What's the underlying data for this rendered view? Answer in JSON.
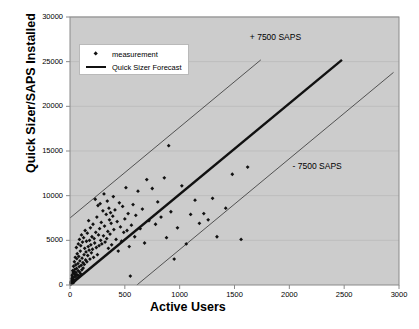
{
  "chart_data": {
    "type": "scatter",
    "title": "",
    "xlabel": "Active Users",
    "ylabel": "Quick Sizer/SAPS Installed",
    "xlim": [
      0,
      3000
    ],
    "ylim": [
      0,
      30000
    ],
    "xticks": [
      0,
      500,
      1000,
      1500,
      2000,
      2500,
      3000
    ],
    "yticks": [
      0,
      5000,
      10000,
      15000,
      20000,
      25000,
      30000
    ],
    "grid": "horizontal",
    "legend_position": "upper-left-inside",
    "legend": [
      {
        "label": "measurement",
        "marker": "diamond",
        "color": "#111111"
      },
      {
        "label": "Quick Sizer Forecast",
        "marker": "line",
        "color": "#111111"
      }
    ],
    "annotations": [
      {
        "text": "+ 7500 SAPS",
        "x": 1640,
        "y": 28300
      },
      {
        "text": "- 7500 SAPS",
        "x": 2030,
        "y": 13900
      }
    ],
    "series": [
      {
        "name": "Quick Sizer Forecast",
        "type": "line",
        "style": "thick",
        "color": "#111111",
        "points": [
          [
            0,
            0
          ],
          [
            2480,
            25200
          ]
        ]
      },
      {
        "name": "+ 7500 SAPS",
        "type": "line",
        "style": "thin",
        "color": "#444444",
        "points": [
          [
            0,
            7500
          ],
          [
            1740,
            25200
          ]
        ]
      },
      {
        "name": "- 7500 SAPS",
        "type": "line",
        "style": "thin",
        "color": "#444444",
        "points": [
          [
            610,
            0
          ],
          [
            2950,
            23800
          ]
        ]
      },
      {
        "name": "measurement",
        "type": "scatter",
        "marker": "diamond",
        "color": "#111111",
        "points": [
          [
            8,
            250
          ],
          [
            10,
            420
          ],
          [
            12,
            150
          ],
          [
            14,
            700
          ],
          [
            16,
            300
          ],
          [
            18,
            1100
          ],
          [
            20,
            480
          ],
          [
            22,
            900
          ],
          [
            24,
            1600
          ],
          [
            26,
            200
          ],
          [
            28,
            1350
          ],
          [
            30,
            600
          ],
          [
            32,
            2100
          ],
          [
            34,
            850
          ],
          [
            36,
            1500
          ],
          [
            38,
            380
          ],
          [
            40,
            2600
          ],
          [
            42,
            1200
          ],
          [
            44,
            1750
          ],
          [
            46,
            520
          ],
          [
            48,
            3100
          ],
          [
            50,
            980
          ],
          [
            52,
            2250
          ],
          [
            54,
            1400
          ],
          [
            56,
            640
          ],
          [
            58,
            4200
          ],
          [
            60,
            1850
          ],
          [
            62,
            2950
          ],
          [
            64,
            1150
          ],
          [
            66,
            3500
          ],
          [
            70,
            800
          ],
          [
            72,
            2400
          ],
          [
            74,
            1600
          ],
          [
            76,
            4600
          ],
          [
            78,
            1050
          ],
          [
            80,
            3200
          ],
          [
            84,
            2050
          ],
          [
            86,
            5100
          ],
          [
            88,
            1450
          ],
          [
            90,
            2700
          ],
          [
            94,
            3800
          ],
          [
            96,
            1250
          ],
          [
            98,
            4400
          ],
          [
            102,
            2200
          ],
          [
            105,
            5600
          ],
          [
            108,
            1700
          ],
          [
            110,
            3000
          ],
          [
            114,
            4800
          ],
          [
            118,
            2500
          ],
          [
            120,
            1900
          ],
          [
            124,
            5300
          ],
          [
            128,
            3400
          ],
          [
            130,
            2300
          ],
          [
            134,
            4100
          ],
          [
            138,
            6100
          ],
          [
            142,
            2800
          ],
          [
            146,
            3700
          ],
          [
            150,
            4900
          ],
          [
            154,
            2600
          ],
          [
            158,
            5800
          ],
          [
            162,
            3300
          ],
          [
            166,
            4300
          ],
          [
            170,
            7200
          ],
          [
            174,
            3900
          ],
          [
            178,
            5000
          ],
          [
            182,
            2900
          ],
          [
            186,
            6400
          ],
          [
            190,
            4500
          ],
          [
            195,
            3600
          ],
          [
            200,
            5400
          ],
          [
            205,
            4000
          ],
          [
            210,
            6800
          ],
          [
            215,
            3100
          ],
          [
            220,
            5200
          ],
          [
            225,
            4700
          ],
          [
            230,
            9600
          ],
          [
            235,
            5900
          ],
          [
            240,
            4200
          ],
          [
            245,
            7600
          ],
          [
            250,
            3400
          ],
          [
            255,
            8900
          ],
          [
            260,
            5600
          ],
          [
            265,
            4400
          ],
          [
            270,
            6300
          ],
          [
            275,
            9100
          ],
          [
            280,
            5000
          ],
          [
            285,
            7000
          ],
          [
            290,
            4600
          ],
          [
            300,
            8300
          ],
          [
            305,
            5500
          ],
          [
            310,
            10200
          ],
          [
            315,
            6600
          ],
          [
            320,
            4800
          ],
          [
            330,
            7900
          ],
          [
            335,
            5200
          ],
          [
            340,
            9400
          ],
          [
            345,
            6000
          ],
          [
            350,
            4100
          ],
          [
            355,
            8600
          ],
          [
            360,
            7300
          ],
          [
            365,
            5700
          ],
          [
            370,
            8100
          ],
          [
            375,
            6900
          ],
          [
            380,
            4500
          ],
          [
            390,
            7700
          ],
          [
            395,
            9900
          ],
          [
            400,
            6200
          ],
          [
            410,
            8400
          ],
          [
            420,
            5100
          ],
          [
            430,
            7100
          ],
          [
            440,
            3800
          ],
          [
            450,
            9200
          ],
          [
            460,
            6500
          ],
          [
            470,
            4900
          ],
          [
            480,
            8800
          ],
          [
            490,
            5900
          ],
          [
            500,
            7400
          ],
          [
            510,
            10900
          ],
          [
            520,
            6100
          ],
          [
            530,
            8000
          ],
          [
            540,
            4300
          ],
          [
            550,
            1000
          ],
          [
            560,
            6700
          ],
          [
            575,
            9000
          ],
          [
            590,
            5400
          ],
          [
            600,
            7800
          ],
          [
            620,
            10500
          ],
          [
            640,
            6300
          ],
          [
            660,
            8500
          ],
          [
            680,
            4700
          ],
          [
            700,
            11800
          ],
          [
            720,
            7200
          ],
          [
            750,
            10800
          ],
          [
            780,
            6800
          ],
          [
            800,
            9300
          ],
          [
            830,
            7600
          ],
          [
            860,
            12000
          ],
          [
            880,
            5300
          ],
          [
            900,
            15600
          ],
          [
            920,
            8200
          ],
          [
            950,
            2900
          ],
          [
            980,
            6400
          ],
          [
            1020,
            11100
          ],
          [
            1060,
            4600
          ],
          [
            1100,
            7900
          ],
          [
            1140,
            9500
          ],
          [
            1180,
            6900
          ],
          [
            1220,
            8000
          ],
          [
            1260,
            7300
          ],
          [
            1300,
            9700
          ],
          [
            1340,
            5400
          ],
          [
            1420,
            8600
          ],
          [
            1480,
            12400
          ],
          [
            1560,
            5100
          ],
          [
            1620,
            13200
          ]
        ]
      }
    ]
  },
  "axes": {
    "x_tick_labels": [
      "0",
      "500",
      "1000",
      "1500",
      "2000",
      "2500",
      "3000"
    ],
    "y_tick_labels": [
      "0",
      "5000",
      "10000",
      "15000",
      "20000",
      "25000",
      "30000"
    ],
    "x_title": "Active Users",
    "y_title": "Quick Sizer/SAPS Installed"
  },
  "colors": {
    "plot_background": "#cccccc",
    "page_background": "#ffffff",
    "gridline": "#bdbdbd",
    "axis": "#8a8a8a",
    "marker": "#111111",
    "forecast_line": "#111111",
    "band_line": "#4a4a4a"
  }
}
